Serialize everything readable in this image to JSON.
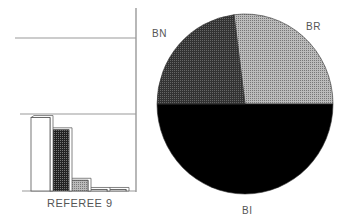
{
  "chart_data": [
    {
      "type": "bar",
      "title": "REFEREE 9",
      "xlabel": "REFEREE 9",
      "ylabel": "",
      "categories": [
        "bar1",
        "bar2",
        "bar3",
        "bar4",
        "bar5"
      ],
      "values": [
        48,
        40,
        7,
        1,
        1
      ],
      "fills": [
        "white",
        "dark-checker",
        "light-checker",
        "white",
        "white"
      ],
      "ylim": [
        0,
        100
      ],
      "gridlines": [
        50,
        100
      ],
      "style": "3d"
    },
    {
      "type": "pie",
      "title": "",
      "labels": [
        "BR",
        "BI",
        "BN"
      ],
      "values": [
        27,
        50,
        23
      ],
      "colors": [
        "#aaaaaa",
        "#000000",
        "#444444"
      ]
    }
  ],
  "labels": {
    "bar_caption": "REFEREE 9",
    "pie_br": "BR",
    "pie_bi": "BI",
    "pie_bn": "BN"
  }
}
